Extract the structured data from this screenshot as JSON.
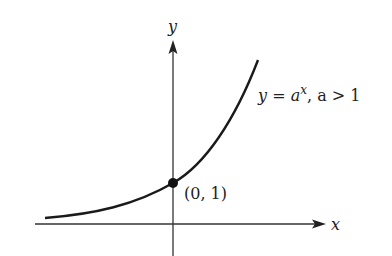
{
  "diagram": {
    "axes": {
      "x_label": "x",
      "y_label": "y"
    },
    "curve": {
      "equation_lhs": "y",
      "equation_eq": " = ",
      "equation_base": "a",
      "equation_exp": "x",
      "equation_cond": ", a > 1",
      "color": "#1a1a1a"
    },
    "point": {
      "label": "(0, 1)"
    }
  }
}
